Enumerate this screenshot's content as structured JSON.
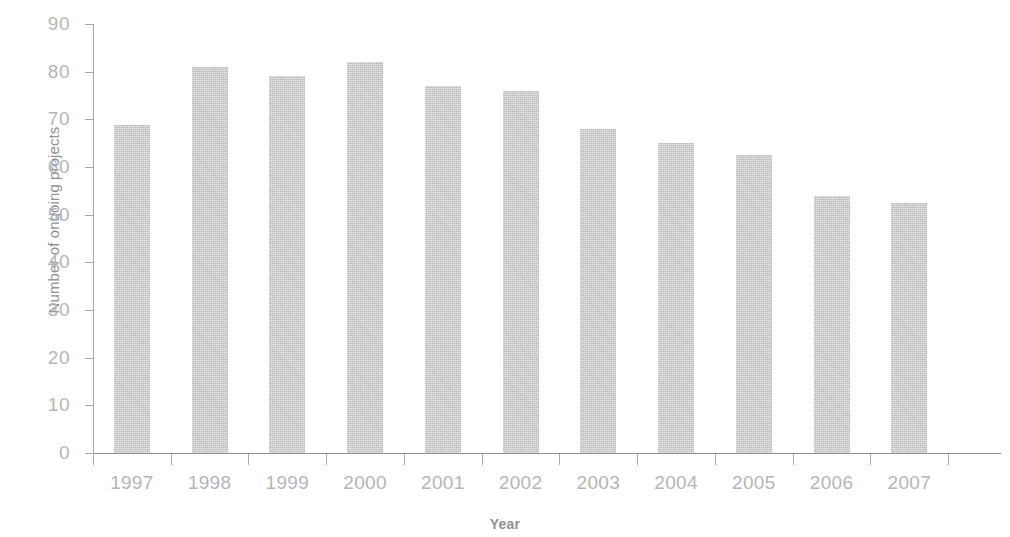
{
  "chart_data": {
    "type": "bar",
    "title": "",
    "xlabel": "Year",
    "ylabel": "Number of ongoing projects",
    "categories": [
      "1997",
      "1998",
      "1999",
      "2000",
      "2001",
      "2002",
      "2003",
      "2004",
      "2005",
      "2006",
      "2007"
    ],
    "values": [
      68.8,
      81.0,
      79.0,
      82.0,
      77.0,
      76.0,
      68.0,
      65.0,
      62.5,
      54.0,
      52.5
    ],
    "series": [
      {
        "name": "Number of ongoing projects",
        "values": [
          68.8,
          81.0,
          79.0,
          82.0,
          77.0,
          76.0,
          68.0,
          65.0,
          62.5,
          54.0,
          52.5
        ]
      }
    ],
    "ylim": [
      0,
      90
    ],
    "ytick_labels": [
      "0",
      "10",
      "20",
      "30",
      "40",
      "50",
      "60",
      "70",
      "80",
      "90"
    ],
    "ytick_values": [
      0,
      10,
      20,
      30,
      40,
      50,
      60,
      70,
      80,
      90
    ],
    "grid": false,
    "legend": null,
    "bar_color": "#c6c7c8",
    "axis_color": "#a8aaac",
    "text_color": "#b4b6b8",
    "axis_title_color": "#8f9194"
  }
}
